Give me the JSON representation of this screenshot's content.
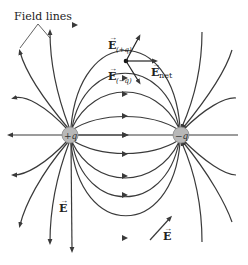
{
  "diagram": {
    "title_label": "Field lines",
    "positive_charge": {
      "label": "+q",
      "x": 70,
      "y": 135
    },
    "negative_charge": {
      "label": "−q",
      "x": 181,
      "y": 135
    },
    "vectors": {
      "e_plus": {
        "symbol": "E",
        "subscript": "(+q)"
      },
      "e_minus": {
        "symbol": "E",
        "subscript": "(−q)"
      },
      "e_net": {
        "symbol": "E",
        "subscript": "net"
      },
      "e_left": {
        "symbol": "E"
      },
      "e_right": {
        "symbol": "E"
      }
    },
    "colors": {
      "line": "#3a3a3a",
      "charge_fill": "#b8b8b8",
      "background": "#ffffff"
    }
  }
}
